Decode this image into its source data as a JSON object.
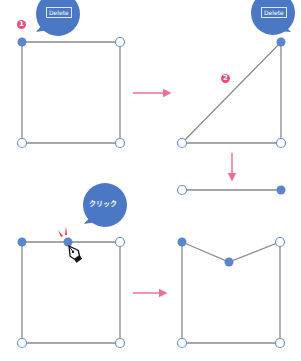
{
  "colors": {
    "node_fill": "#5b86cc",
    "node_stroke": "#6a93d4",
    "edge": "#8a8a8a",
    "bubble": "#4a78c4",
    "arrow": "#ec6fa0",
    "badge": "#ea4c82",
    "spark": "#e53a3a"
  },
  "bubbles": {
    "step1": "Delete",
    "step2": "Delete",
    "step3": "クリック"
  },
  "badges": {
    "step1": "1",
    "step2": "2"
  },
  "panels": [
    {
      "name": "square-with-selected-corner",
      "selected_nodes": [
        "top-left"
      ]
    },
    {
      "name": "triangle-after-delete",
      "selected_nodes": [
        "top-right"
      ]
    },
    {
      "name": "open-line",
      "selected_nodes": [
        "right"
      ]
    },
    {
      "name": "square-add-anchor-click",
      "selected_nodes": [
        "top-left",
        "top-middle"
      ]
    },
    {
      "name": "notched-pentagon-result",
      "selected_nodes": [
        "top-left",
        "middle-dip"
      ]
    }
  ]
}
